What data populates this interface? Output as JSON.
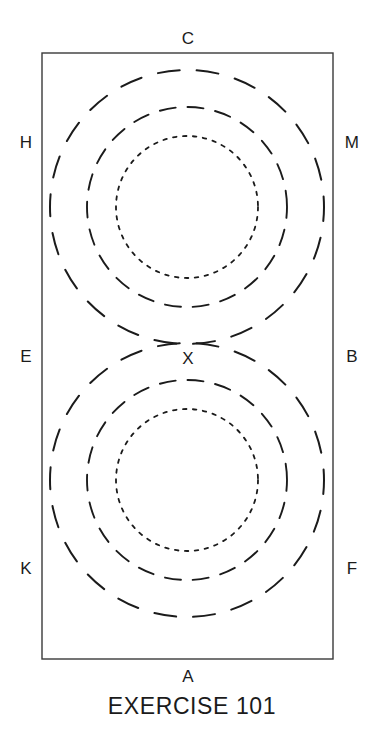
{
  "figure": {
    "caption": "EXERCISE 101",
    "frame": {
      "x": 42,
      "y": 53,
      "width": 291,
      "height": 606,
      "stroke_color": "#3a3a3a",
      "stroke_width": 1.4,
      "fill": "#ffffff"
    },
    "background_color": "#ffffff",
    "ink_color": "#1b1b1b"
  },
  "corner_labels": [
    {
      "name": "top",
      "text": "C",
      "x": 188,
      "y": 38
    },
    {
      "name": "bottom",
      "text": "A",
      "x": 188,
      "y": 676
    },
    {
      "name": "upper-left",
      "text": "H",
      "x": 26,
      "y": 142
    },
    {
      "name": "upper-right",
      "text": "M",
      "x": 352,
      "y": 142
    },
    {
      "name": "middle-left",
      "text": "E",
      "x": 26,
      "y": 356
    },
    {
      "name": "middle-right",
      "text": "B",
      "x": 352,
      "y": 356
    },
    {
      "name": "lower-left",
      "text": "K",
      "x": 26,
      "y": 568
    },
    {
      "name": "lower-right",
      "text": "F",
      "x": 352,
      "y": 568
    }
  ],
  "point_labels": [
    {
      "name": "tangency-point",
      "text": "X",
      "x": 188,
      "y": 358
    }
  ],
  "circles": [
    {
      "group": "upper",
      "name": "upper-outer-circle",
      "cx": 187,
      "cy": 207,
      "r": 137,
      "style": "long-dash",
      "dash": "22 17",
      "dash_offset": 8,
      "stroke_width": 2.0
    },
    {
      "group": "upper",
      "name": "upper-middle-circle",
      "cx": 187,
      "cy": 207,
      "r": 100,
      "style": "medium-dash",
      "dash": "16 12",
      "dash_offset": 5,
      "stroke_width": 1.9
    },
    {
      "group": "upper",
      "name": "upper-inner-circle",
      "cx": 187,
      "cy": 207,
      "r": 71,
      "style": "dotted",
      "dash": "3.5 6.5",
      "dash_offset": 0,
      "stroke_width": 1.8
    },
    {
      "group": "lower",
      "name": "lower-outer-circle",
      "cx": 187,
      "cy": 480,
      "r": 137,
      "style": "long-dash",
      "dash": "22 17",
      "dash_offset": 8,
      "stroke_width": 2.0
    },
    {
      "group": "lower",
      "name": "lower-middle-circle",
      "cx": 187,
      "cy": 480,
      "r": 100,
      "style": "medium-dash",
      "dash": "16 12",
      "dash_offset": 5,
      "stroke_width": 1.9
    },
    {
      "group": "lower",
      "name": "lower-inner-circle",
      "cx": 187,
      "cy": 480,
      "r": 71,
      "style": "dotted",
      "dash": "3.5 6.5",
      "dash_offset": 0,
      "stroke_width": 1.8
    }
  ]
}
